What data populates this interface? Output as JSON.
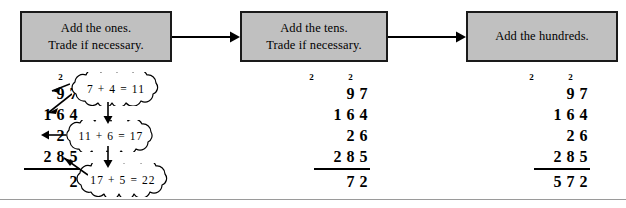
{
  "steps": [
    {
      "id": "ones",
      "line1": "Add the ones.",
      "line2": "Trade if necessary."
    },
    {
      "id": "tens",
      "line1": "Add the tens.",
      "line2": "Trade if necessary."
    },
    {
      "id": "hundreds",
      "line1": "Add the hundreds.",
      "line2": ""
    }
  ],
  "problem": {
    "addends": [
      "97",
      "164",
      "26",
      "285"
    ],
    "total": "572"
  },
  "columns": [
    {
      "id": "step-ones",
      "carry_top": [
        "",
        "2",
        ""
      ],
      "carry_left": "",
      "rows": [
        {
          "digits": [
            "",
            "9",
            "7"
          ]
        },
        {
          "digits": [
            "1",
            "6",
            "4"
          ]
        },
        {
          "digits": [
            "",
            "2",
            "6"
          ]
        },
        {
          "digits": [
            "2",
            "8",
            "5"
          ]
        }
      ],
      "answer": [
        "",
        "",
        "2"
      ]
    },
    {
      "id": "step-tens",
      "carry_top": [
        "",
        "2",
        ""
      ],
      "carry_left": "2",
      "rows": [
        {
          "digits": [
            "",
            "9",
            "7"
          ]
        },
        {
          "digits": [
            "1",
            "6",
            "4"
          ]
        },
        {
          "digits": [
            "",
            "2",
            "6"
          ]
        },
        {
          "digits": [
            "2",
            "8",
            "5"
          ]
        }
      ],
      "answer": [
        "",
        "7",
        "2"
      ]
    },
    {
      "id": "step-hundreds",
      "carry_top": [
        "",
        "2",
        ""
      ],
      "carry_left": "2",
      "rows": [
        {
          "digits": [
            "",
            "9",
            "7"
          ]
        },
        {
          "digits": [
            "1",
            "6",
            "4"
          ]
        },
        {
          "digits": [
            "",
            "2",
            "6"
          ]
        },
        {
          "digits": [
            "2",
            "8",
            "5"
          ]
        }
      ],
      "answer": [
        "5",
        "7",
        "2"
      ]
    }
  ],
  "callouts": [
    {
      "id": "ones-1",
      "text": "7 + 4 = 11"
    },
    {
      "id": "ones-2",
      "text": "11 + 6 = 17"
    },
    {
      "id": "ones-3",
      "text": "17 + 5 = 22"
    }
  ],
  "colors": {
    "box_fill": "#c0c0c0",
    "box_border": "#1a1a1a",
    "ink": "#000000",
    "rule": "#9a9a9a"
  }
}
